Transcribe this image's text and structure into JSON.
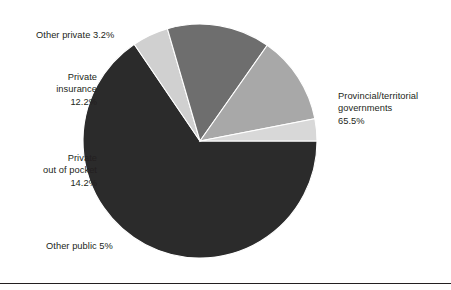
{
  "chart_data": {
    "type": "pie",
    "title": "",
    "subtitle": "",
    "xlabel": "",
    "ylabel": "",
    "legend_position": "callout-labels",
    "grid": false,
    "start_angle_deg": 0,
    "direction": "clockwise",
    "center": {
      "x": 200,
      "y": 141
    },
    "radius": 117,
    "categories": [
      "Provincial/territorial governments",
      "Other public",
      "Private out of pocket",
      "Private insurance",
      "Other private"
    ],
    "values": [
      65.5,
      5,
      14.2,
      12.2,
      3.2
    ],
    "value_labels": [
      "65.5%",
      "5%",
      "14.2%",
      "12.2%",
      "3.2%"
    ],
    "colors": [
      "#2b2b2b",
      "#d0d0d0",
      "#6e6e6e",
      "#a8a8a8",
      "#d8d8d8"
    ],
    "slices": [
      {
        "name": "provincial-territorial-governments",
        "label": "Provincial/territorial",
        "label_line2": "governments",
        "value_text": "65.5%",
        "value": 65.5,
        "color": "#2b2b2b",
        "start_deg": 0,
        "end_deg": 235.8
      },
      {
        "name": "other-public",
        "label": "Other public 5%",
        "value_text": "5%",
        "value": 5,
        "color": "#d0d0d0",
        "start_deg": 235.8,
        "end_deg": 253.8
      },
      {
        "name": "private-out-of-pocket",
        "label": "Private",
        "label_line2": "out of pocket",
        "value_text": "14.2%",
        "value": 14.2,
        "color": "#6e6e6e",
        "start_deg": 253.8,
        "end_deg": 305.1
      },
      {
        "name": "private-insurance",
        "label": "Private",
        "label_line2": "insurance",
        "value_text": "12.2%",
        "value": 12.2,
        "color": "#a8a8a8",
        "start_deg": 305.1,
        "end_deg": 349.0
      },
      {
        "name": "other-private",
        "label": "Other private 3.2%",
        "value_text": "3.2%",
        "value": 3.2,
        "color": "#d8d8d8",
        "start_deg": 349.0,
        "end_deg": 360.0
      }
    ]
  },
  "labels": {
    "other_private": "Other private 3.2%",
    "private_insurance": "Private\ninsurance\n12.2%",
    "out_of_pocket": "Private\nout of pocket\n14.2%",
    "other_public": "Other public 5%",
    "provincial": "Provincial/territorial\ngovernments\n65.5%"
  },
  "style": {
    "text_color": "#231f20",
    "background": "#ffffff",
    "rule_color": "#231f20"
  }
}
